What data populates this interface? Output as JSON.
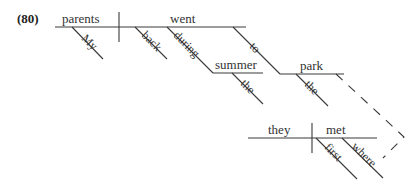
{
  "example_number": "(80)",
  "diagram_type": "Reed-Kellogg sentence diagram",
  "sentence": {
    "main_clause": {
      "subject": "parents",
      "subject_modifiers": [
        "My"
      ],
      "verb": "went",
      "verb_modifiers": [
        "back",
        "during",
        "to"
      ],
      "prepositional_phrases": [
        {
          "preposition": "during",
          "object": "summer",
          "object_modifiers": [
            "the"
          ]
        },
        {
          "preposition": "to",
          "object": "park",
          "object_modifiers": [
            "the"
          ]
        }
      ]
    },
    "relative_clause": {
      "subject": "they",
      "verb": "met",
      "verb_modifiers": [
        "first",
        "where"
      ],
      "connector": "dashed line linking 'where' to 'park'"
    }
  },
  "labels": {
    "parents": "parents",
    "my": "My",
    "went": "went",
    "back": "back",
    "during": "during",
    "summer": "summer",
    "the_summer": "the",
    "to": "to",
    "park": "park",
    "the_park": "the",
    "they": "they",
    "met": "met",
    "first": "first",
    "where": "where"
  },
  "colors": {
    "line": "#3a3a3a",
    "text": "#333333",
    "background": "#ffffff"
  }
}
